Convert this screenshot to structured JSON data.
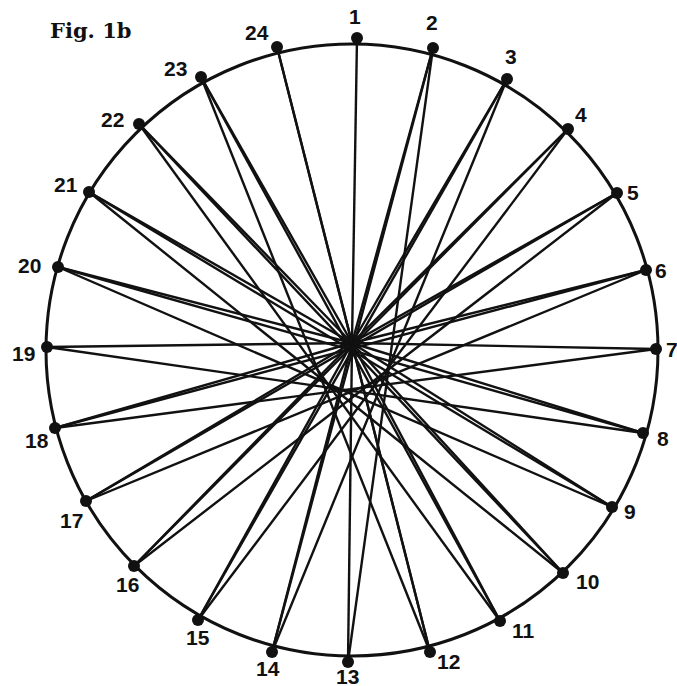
{
  "figure": {
    "title": "Fig. 1b",
    "circle": {
      "cx": 352,
      "cy": 350,
      "r": 306,
      "color": "#111111"
    },
    "hub": {
      "x": 352,
      "y": 343
    },
    "points": [
      {
        "label": "1",
        "x": 357,
        "y": 38,
        "lx": 349,
        "ly": 24
      },
      {
        "label": "2",
        "x": 433,
        "y": 48,
        "lx": 426,
        "ly": 30
      },
      {
        "label": "3",
        "x": 507,
        "y": 79,
        "lx": 505,
        "ly": 64
      },
      {
        "label": "4",
        "x": 568,
        "y": 129,
        "lx": 575,
        "ly": 122
      },
      {
        "label": "5",
        "x": 617,
        "y": 193,
        "lx": 627,
        "ly": 200
      },
      {
        "label": "6",
        "x": 646,
        "y": 270,
        "lx": 655,
        "ly": 278
      },
      {
        "label": "7",
        "x": 656,
        "y": 349,
        "lx": 666,
        "ly": 357
      },
      {
        "label": "8",
        "x": 643,
        "y": 433,
        "lx": 657,
        "ly": 446
      },
      {
        "label": "9",
        "x": 612,
        "y": 507,
        "lx": 624,
        "ly": 519
      },
      {
        "label": "10",
        "x": 563,
        "y": 573,
        "lx": 576,
        "ly": 589
      },
      {
        "label": "11",
        "x": 500,
        "y": 621,
        "lx": 512,
        "ly": 638
      },
      {
        "label": "12",
        "x": 430,
        "y": 652,
        "lx": 437,
        "ly": 669
      },
      {
        "label": "13",
        "x": 348,
        "y": 662,
        "lx": 336,
        "ly": 684
      },
      {
        "label": "14",
        "x": 272,
        "y": 652,
        "lx": 256,
        "ly": 676
      },
      {
        "label": "15",
        "x": 198,
        "y": 620,
        "lx": 186,
        "ly": 645
      },
      {
        "label": "16",
        "x": 134,
        "y": 566,
        "lx": 116,
        "ly": 592
      },
      {
        "label": "17",
        "x": 86,
        "y": 501,
        "lx": 60,
        "ly": 528
      },
      {
        "label": "18",
        "x": 55,
        "y": 428,
        "lx": 25,
        "ly": 448
      },
      {
        "label": "19",
        "x": 47,
        "y": 347,
        "lx": 12,
        "ly": 361
      },
      {
        "label": "20",
        "x": 58,
        "y": 267,
        "lx": 18,
        "ly": 273
      },
      {
        "label": "21",
        "x": 89,
        "y": 192,
        "lx": 54,
        "ly": 192
      },
      {
        "label": "22",
        "x": 139,
        "y": 124,
        "lx": 101,
        "ly": 127
      },
      {
        "label": "23",
        "x": 201,
        "y": 77,
        "lx": 164,
        "ly": 76
      },
      {
        "label": "24",
        "x": 277,
        "y": 47,
        "lx": 245,
        "ly": 40
      }
    ],
    "chords": [
      [
        2,
        13
      ],
      [
        3,
        14
      ],
      [
        4,
        15
      ],
      [
        5,
        16
      ],
      [
        6,
        17
      ],
      [
        7,
        18
      ],
      [
        8,
        19
      ],
      [
        9,
        20
      ],
      [
        10,
        21
      ],
      [
        11,
        22
      ],
      [
        12,
        23
      ],
      [
        14,
        2
      ],
      [
        15,
        3
      ],
      [
        16,
        4
      ],
      [
        17,
        5
      ],
      [
        18,
        6
      ],
      [
        20,
        8
      ],
      [
        21,
        9
      ],
      [
        22,
        10
      ],
      [
        23,
        11
      ],
      [
        24,
        12
      ]
    ]
  }
}
